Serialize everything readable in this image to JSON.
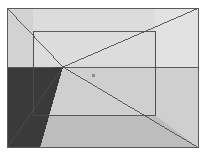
{
  "figure": {
    "canvas": {
      "width": 206,
      "height": 156
    },
    "background_color": "#ffffff"
  },
  "palette": {
    "outer_frame_border": "#5a5a5a",
    "ceiling_light": "#dcdcdc",
    "upper_left_wall": "#d2d2d2",
    "back_wall_light": "#e2e2e2",
    "right_wall": "#cfcfcf",
    "floor": "#bdbdbd",
    "shadow_dark": "#3a3a3a",
    "line_stroke": "#4c4c4c",
    "marker_color": "#8a8a8a"
  },
  "geometry": {
    "outer_rect": {
      "x": 7,
      "y": 8,
      "width": 192,
      "height": 140
    },
    "inner_rect": {
      "x": 33,
      "y": 31,
      "width": 122,
      "height": 84
    },
    "vanishing_point": {
      "x": 63,
      "y": 67
    },
    "horizon_line_y": 67,
    "marker_point": {
      "x": 93,
      "y": 75
    },
    "shadow_polygon": "7,68 40,68 63,67 40,148 7,148",
    "diagonals": [
      {
        "name": "top-left-corner-ray",
        "from": [
          7,
          8
        ],
        "to": [
          63,
          67
        ]
      },
      {
        "name": "top-right-corner-ray",
        "from": [
          199,
          8
        ],
        "to": [
          63,
          67
        ]
      },
      {
        "name": "bottom-right-corner-ray",
        "from": [
          199,
          148
        ],
        "to": [
          63,
          67
        ]
      },
      {
        "name": "bottom-left-corner-ray",
        "from": [
          7,
          148
        ],
        "to": [
          63,
          67
        ]
      }
    ]
  },
  "labels": {
    "vanishing_point": "vanishing point",
    "horizon": "horizon line",
    "shadow_region": "shadow region",
    "inner_rect": "back wall",
    "outer_rect": "picture frame",
    "marker": "reference marker"
  },
  "caption": ""
}
